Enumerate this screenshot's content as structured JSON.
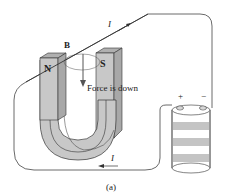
{
  "figure": {
    "caption": "(a)",
    "labels": {
      "north_pole": "N",
      "south_pole": "S",
      "field": "B",
      "force": "Force is down",
      "current_top": "I",
      "current_bottom": "I",
      "battery_positive": "+",
      "battery_negative": "−"
    },
    "colors": {
      "magnet_fill": "#c8c8c8",
      "magnet_dark": "#a8a8a8",
      "magnet_top": "#b0b0b0",
      "outline": "#333333",
      "battery_band": "#c4c4c4",
      "background": "#ffffff"
    }
  }
}
